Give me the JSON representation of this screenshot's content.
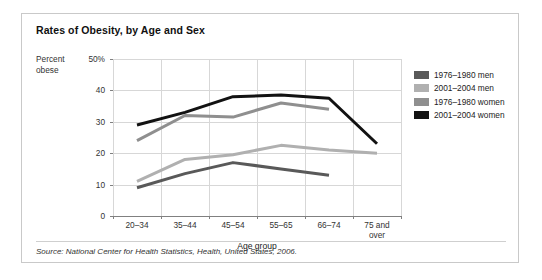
{
  "title": "Rates of Obesity, by Age and Sex",
  "source": "Source: National Center for Health Statistics, Health, United States, 2006.",
  "axis": {
    "ylabel_line1": "Percent",
    "ylabel_line2": "obese",
    "xlabel": "Age group",
    "yticks": [
      "50%",
      "40",
      "30",
      "20",
      "10",
      "0"
    ]
  },
  "legend": {
    "items": [
      {
        "label": "1976–1980 men",
        "color": "#595959"
      },
      {
        "label": "2001–2004 men",
        "color": "#b0b0b0"
      },
      {
        "label": "1976–1980 women",
        "color": "#8f8f8f"
      },
      {
        "label": "2001–2004 women",
        "color": "#121212"
      }
    ]
  },
  "chart_data": {
    "type": "line",
    "title": "Rates of Obesity, by Age and Sex",
    "xlabel": "Age group",
    "ylabel": "Percent obese",
    "categories": [
      "20–34",
      "35–44",
      "45–54",
      "55–65",
      "66–74",
      "75 and over"
    ],
    "ylim": [
      0,
      50
    ],
    "yticks": [
      0,
      10,
      20,
      30,
      40,
      50
    ],
    "grid": true,
    "legend_position": "right",
    "series": [
      {
        "name": "1976–1980 men",
        "color": "#595959",
        "values": [
          9,
          13.5,
          17,
          15,
          13,
          null
        ]
      },
      {
        "name": "2001–2004 men",
        "color": "#b0b0b0",
        "values": [
          11,
          18,
          19.5,
          22.5,
          21,
          20
        ]
      },
      {
        "name": "1976–1980 women",
        "color": "#8f8f8f",
        "values": [
          24,
          32,
          31.5,
          36,
          34,
          null
        ]
      },
      {
        "name": "2001–2004 women",
        "color": "#121212",
        "values": [
          29,
          33,
          38,
          38.5,
          37.5,
          23
        ]
      }
    ]
  }
}
